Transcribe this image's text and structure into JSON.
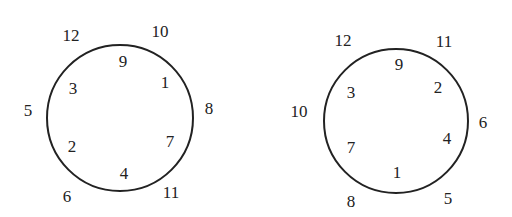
{
  "diagrams": [
    {
      "name": "left-circle",
      "circle": {
        "cx": 120,
        "cy": 118,
        "r": 74
      },
      "labels": [
        {
          "text": "12",
          "x": 71,
          "y": 35,
          "position": "outside"
        },
        {
          "text": "10",
          "x": 160,
          "y": 31,
          "position": "outside"
        },
        {
          "text": "9",
          "x": 123,
          "y": 61,
          "position": "inside"
        },
        {
          "text": "1",
          "x": 165,
          "y": 82,
          "position": "inside"
        },
        {
          "text": "3",
          "x": 73,
          "y": 88,
          "position": "inside"
        },
        {
          "text": "5",
          "x": 28,
          "y": 110,
          "position": "outside"
        },
        {
          "text": "8",
          "x": 209,
          "y": 108,
          "position": "outside"
        },
        {
          "text": "2",
          "x": 72,
          "y": 146,
          "position": "inside"
        },
        {
          "text": "7",
          "x": 170,
          "y": 141,
          "position": "inside"
        },
        {
          "text": "4",
          "x": 124,
          "y": 173,
          "position": "inside"
        },
        {
          "text": "6",
          "x": 67,
          "y": 196,
          "position": "outside"
        },
        {
          "text": "11",
          "x": 171,
          "y": 192,
          "position": "outside"
        }
      ]
    },
    {
      "name": "right-circle",
      "circle": {
        "cx": 396,
        "cy": 121,
        "r": 73
      },
      "labels": [
        {
          "text": "12",
          "x": 343,
          "y": 40,
          "position": "outside"
        },
        {
          "text": "11",
          "x": 444,
          "y": 41,
          "position": "outside"
        },
        {
          "text": "9",
          "x": 399,
          "y": 64,
          "position": "inside"
        },
        {
          "text": "2",
          "x": 438,
          "y": 87,
          "position": "inside"
        },
        {
          "text": "3",
          "x": 351,
          "y": 92,
          "position": "inside"
        },
        {
          "text": "10",
          "x": 299,
          "y": 111,
          "position": "outside"
        },
        {
          "text": "6",
          "x": 483,
          "y": 122,
          "position": "outside"
        },
        {
          "text": "4",
          "x": 447,
          "y": 138,
          "position": "inside"
        },
        {
          "text": "7",
          "x": 351,
          "y": 147,
          "position": "inside"
        },
        {
          "text": "1",
          "x": 397,
          "y": 172,
          "position": "inside"
        },
        {
          "text": "8",
          "x": 351,
          "y": 201,
          "position": "outside"
        },
        {
          "text": "5",
          "x": 448,
          "y": 198,
          "position": "outside"
        }
      ]
    }
  ]
}
